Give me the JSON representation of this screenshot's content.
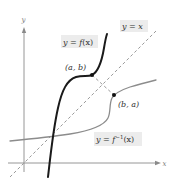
{
  "diagram": {
    "axes": {
      "x_label": "x",
      "y_label": "y"
    },
    "labels": {
      "f": "y = f(x)",
      "f_prefix": "y = ",
      "f_name": "f",
      "f_arg": "(x)",
      "identity": "y = x",
      "finv_prefix": "y = ",
      "finv_name": "f",
      "finv_sup": "−1",
      "finv_arg": "(x)",
      "point_ab": "(a, b)",
      "point_ba": "(b, a)"
    },
    "curves": [
      {
        "name": "f",
        "label": "y = f(x)",
        "style": "solid-black-thick"
      },
      {
        "name": "f_inverse",
        "label": "y = f^-1(x)",
        "style": "solid-gray"
      },
      {
        "name": "identity",
        "label": "y = x",
        "style": "dashed-gray"
      }
    ],
    "points": [
      {
        "label": "(a, b)",
        "on": "f"
      },
      {
        "label": "(b, a)",
        "on": "f_inverse"
      }
    ],
    "colors": {
      "f_curve": "#1a1a1a",
      "finv_curve": "#8c8c8c",
      "identity_line": "#9a9a9a",
      "axes": "#8a8a8a",
      "label_background": "#ececec"
    }
  }
}
